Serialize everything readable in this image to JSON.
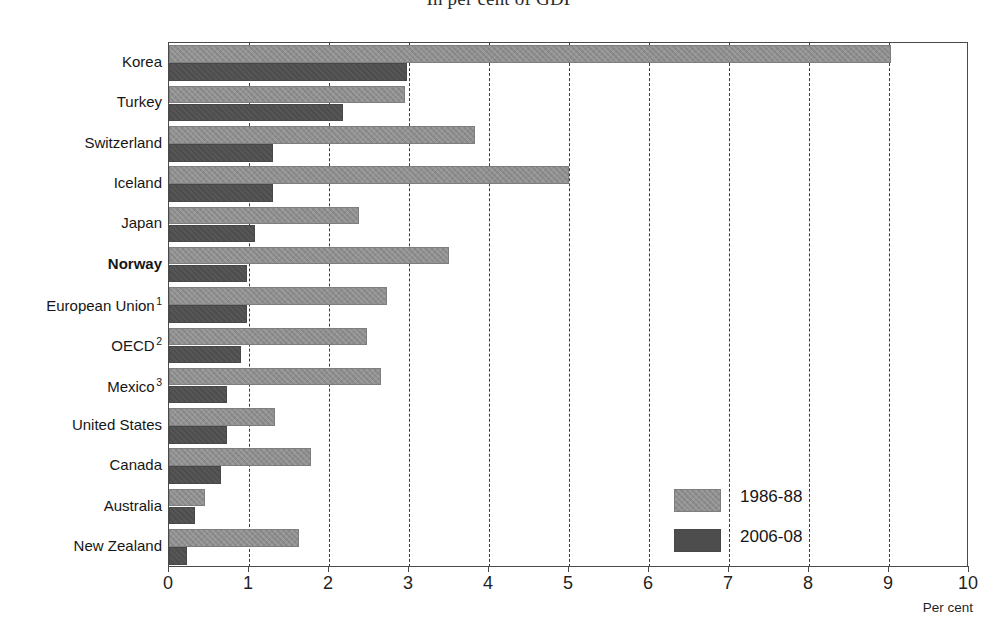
{
  "chart_data": {
    "type": "bar",
    "orientation": "horizontal",
    "title": "In per cent of GDP",
    "xlabel": "Per cent",
    "ylabel": "",
    "xlim": [
      0,
      10
    ],
    "xticks": [
      "0",
      "1",
      "2",
      "3",
      "4",
      "5",
      "6",
      "7",
      "8",
      "9",
      "10"
    ],
    "grid": "vertical-dashed",
    "legend_position": "center-right-inside",
    "categories": [
      "Korea",
      "Turkey",
      "Switzerland",
      "Iceland",
      "Japan",
      "Norway",
      "European Union",
      "OECD",
      "Mexico",
      "United States",
      "Canada",
      "Australia",
      "New Zealand"
    ],
    "category_footnote_markers": [
      "",
      "",
      "",
      "",
      "",
      "",
      "1",
      "2",
      "3",
      "",
      "",
      "",
      ""
    ],
    "highlighted_category": "Norway",
    "series": [
      {
        "name": "1986-88",
        "color": "#8d8d8d",
        "values": [
          9.02,
          2.95,
          3.82,
          5.0,
          2.38,
          3.5,
          2.72,
          2.48,
          2.65,
          1.33,
          1.77,
          0.45,
          1.63
        ]
      },
      {
        "name": "2006-08",
        "color": "#4d4d4d",
        "values": [
          2.97,
          2.17,
          1.3,
          1.3,
          1.08,
          0.97,
          0.97,
          0.9,
          0.72,
          0.72,
          0.65,
          0.32,
          0.23
        ]
      }
    ]
  },
  "axis": {
    "unit_label": "Per cent"
  },
  "legend": {
    "entries": [
      {
        "label": "1986-88"
      },
      {
        "label": "2006-08"
      }
    ]
  },
  "footnote": {
    "text": ""
  }
}
